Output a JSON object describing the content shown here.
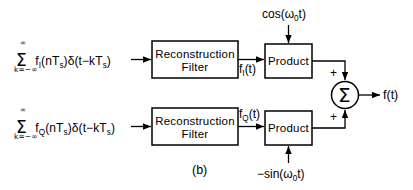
{
  "figure": {
    "caption": "(b)"
  },
  "colors": {
    "stroke": "#000000",
    "background": "#ffffff",
    "text": "#000000"
  },
  "branches": {
    "inphase": {
      "input_sum_sigma": "Σ",
      "input_limit_top": "∞",
      "input_limit_bottom": "k=−∞",
      "input_expression_main": "f",
      "input_expression_sub": "I",
      "input_expression_rest": "(nT",
      "input_expression_sub2": "s",
      "input_expression_rest2": ")δ(t−kT",
      "input_expression_sub3": "s",
      "input_expression_rest3": ")",
      "filter_line1": "Reconstruction",
      "filter_line2": "Filter",
      "signal_label_main": "f",
      "signal_label_sub": "I",
      "signal_label_rest": "(t)",
      "product_label": "Product",
      "carrier_label": "cos(ω",
      "carrier_sub": "0",
      "carrier_rest": "t)",
      "sum_sign": "+"
    },
    "quadrature": {
      "input_sum_sigma": "Σ",
      "input_limit_top": "∞",
      "input_limit_bottom": "k=−∞",
      "input_expression_main": "f",
      "input_expression_sub": "Q",
      "input_expression_rest": "(nT",
      "input_expression_sub2": "s",
      "input_expression_rest2": ")δ(t−kT",
      "input_expression_sub3": "s",
      "input_expression_rest3": ")",
      "filter_line1": "Reconstruction",
      "filter_line2": "Filter",
      "signal_label_main": "f",
      "signal_label_sub": "Q",
      "signal_label_rest": "(t)",
      "product_label": "Product",
      "carrier_label": "−sin(ω",
      "carrier_sub": "0",
      "carrier_rest": "t)",
      "sum_sign": "+"
    }
  },
  "summer": {
    "symbol": "Σ",
    "output_label": "f(t)"
  }
}
